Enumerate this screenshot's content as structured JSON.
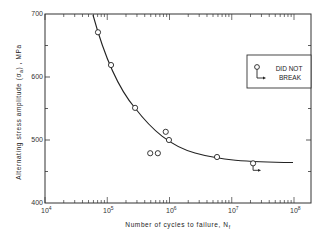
{
  "chart_data": {
    "type": "scatter",
    "title": "",
    "xlabel": "Number of cycles to failure, N",
    "xlabel_subscript": "f",
    "ylabel": "Alternating stress amplitude (σa), MPa",
    "xscale": "log",
    "xlim": [
      10000,
      100000000
    ],
    "ylim": [
      400,
      700
    ],
    "x_ticks": [
      "10^4",
      "10^5",
      "10^6",
      "10^7",
      "10^8"
    ],
    "y_ticks": [
      400,
      500,
      600,
      700
    ],
    "grid": false,
    "series": [
      {
        "name": "Test data",
        "marker": "open-circle",
        "points": [
          {
            "x": 71000,
            "y": 671
          },
          {
            "x": 115000,
            "y": 619
          },
          {
            "x": 280000,
            "y": 551
          },
          {
            "x": 490000,
            "y": 479
          },
          {
            "x": 650000,
            "y": 479
          },
          {
            "x": 870000,
            "y": 513
          },
          {
            "x": 980000,
            "y": 500
          },
          {
            "x": 5800000,
            "y": 473
          }
        ]
      },
      {
        "name": "Did not break",
        "marker": "open-circle-with-arrow",
        "points": [
          {
            "x": 22000000,
            "y": 463
          }
        ]
      },
      {
        "name": "Fitted S-N curve",
        "type": "line",
        "points": [
          {
            "x": 62000,
            "y": 700
          },
          {
            "x": 100000,
            "y": 640
          },
          {
            "x": 200000,
            "y": 575
          },
          {
            "x": 400000,
            "y": 530
          },
          {
            "x": 1000000,
            "y": 495
          },
          {
            "x": 3000000,
            "y": 477
          },
          {
            "x": 10000000,
            "y": 469
          },
          {
            "x": 100000000,
            "y": 466
          }
        ]
      }
    ],
    "legend": {
      "position": "upper right",
      "entries": [
        "DID NOT BREAK"
      ]
    }
  },
  "labels": {
    "y_tick_700": "700",
    "y_tick_600": "600",
    "y_tick_500": "500",
    "y_tick_400": "400",
    "x_tick_base": "10",
    "x_tick_exp_4": "4",
    "x_tick_exp_5": "5",
    "x_tick_exp_6": "6",
    "x_tick_exp_7": "7",
    "x_tick_exp_8": "8",
    "xlabel": "Number of cycles to failure, N",
    "xlabel_sub": "f",
    "ylabel_part1": "Alternating   stress   amplitude   (",
    "ylabel_sigma": "σ",
    "ylabel_sub": "a",
    "ylabel_part2": ") ,  MPa",
    "legend_line1": "DID  NOT",
    "legend_line2": "BREAK"
  }
}
